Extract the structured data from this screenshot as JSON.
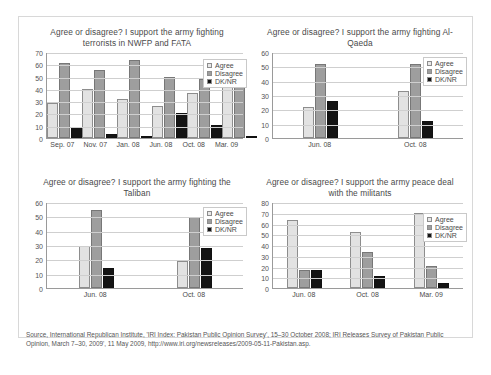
{
  "figure": {
    "source_note": "Source, International Republican Institute, 'IRI Index: Pakistan Public Opinion Survey', 15–30 October 2008; IRI Releases Survey of Pakistan Public Opinion, March 7–30, 2009', 11 May 2009, http://www.iri.org/newsreleases/2009-05-11-Pakistan.asp."
  },
  "legend": {
    "agree": "Agree",
    "disagree": "Disagree",
    "dknr": "DK/NR"
  },
  "chart_data": [
    {
      "type": "bar",
      "title": "Agree or disagree? I support the army fighting terrorists in NWFP and FATA",
      "categories": [
        "Sep. 07",
        "Nov. 07",
        "Jan. 08",
        "Jun. 08",
        "Oct. 08",
        "Mar. 09"
      ],
      "series": [
        {
          "name": "Agree",
          "values": [
            29,
            40,
            32,
            26,
            37,
            43
          ]
        },
        {
          "name": "Disagree",
          "values": [
            62,
            56,
            64,
            50,
            49,
            51
          ]
        },
        {
          "name": "DK/NR",
          "values": [
            9,
            3,
            2,
            21,
            11,
            2
          ]
        }
      ],
      "xlabel": "",
      "ylabel": "",
      "ylim": [
        0,
        70
      ],
      "yticks": [
        0,
        10,
        20,
        30,
        40,
        50,
        60,
        70
      ],
      "grid": true,
      "legend_position": "right"
    },
    {
      "type": "bar",
      "title": "Agree or disagree? I support the army fighting Al-Qaeda",
      "categories": [
        "Jun. 08",
        "Oct. 08"
      ],
      "series": [
        {
          "name": "Agree",
          "values": [
            22,
            33
          ]
        },
        {
          "name": "Disagree",
          "values": [
            52,
            52
          ]
        },
        {
          "name": "DK/NR",
          "values": [
            26,
            12
          ]
        }
      ],
      "xlabel": "",
      "ylabel": "",
      "ylim": [
        0,
        60
      ],
      "yticks": [
        0,
        10,
        20,
        30,
        40,
        50,
        60
      ],
      "grid": true,
      "legend_position": "right"
    },
    {
      "type": "bar",
      "title": "Agree or disagree? I support the army fighting the Taliban",
      "categories": [
        "Jun. 08",
        "Oct. 08"
      ],
      "series": [
        {
          "name": "Agree",
          "values": [
            30,
            19
          ]
        },
        {
          "name": "Disagree",
          "values": [
            55,
            50
          ]
        },
        {
          "name": "DK/NR",
          "values": [
            14,
            28
          ]
        }
      ],
      "xlabel": "",
      "ylabel": "",
      "ylim": [
        0,
        60
      ],
      "yticks": [
        0,
        10,
        20,
        30,
        40,
        50,
        60
      ],
      "grid": true,
      "legend_position": "right"
    },
    {
      "type": "bar",
      "title": "Agree or disagree? I support the army peace deal with the militants",
      "categories": [
        "Jun. 08",
        "Oct. 08",
        "Mar. 09"
      ],
      "series": [
        {
          "name": "Agree",
          "values": [
            64,
            53,
            71
          ]
        },
        {
          "name": "Disagree",
          "values": [
            17,
            34,
            21
          ]
        },
        {
          "name": "DK/NR",
          "values": [
            17,
            11,
            5
          ]
        }
      ],
      "xlabel": "",
      "ylabel": "",
      "ylim": [
        0,
        80
      ],
      "yticks": [
        0,
        10,
        20,
        30,
        40,
        50,
        60,
        70,
        80
      ],
      "grid": true,
      "legend_position": "right"
    }
  ]
}
